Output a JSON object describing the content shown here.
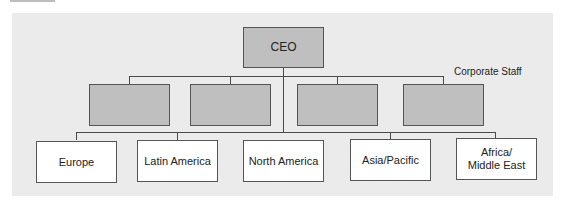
{
  "diagram": {
    "type": "org-chart",
    "root": {
      "label": "CEO"
    },
    "staff_label": "Corporate Staff",
    "staff_boxes": [
      {
        "label": ""
      },
      {
        "label": ""
      },
      {
        "label": ""
      },
      {
        "label": ""
      }
    ],
    "divisions": [
      {
        "label": "Europe"
      },
      {
        "label": "Latin America"
      },
      {
        "label": "North America"
      },
      {
        "label": "Asia/Pacific"
      },
      {
        "label": "Africa/\nMiddle East",
        "line1": "Africa/",
        "line2": "Middle East"
      }
    ],
    "colors": {
      "panel": "#ebebeb",
      "staff_fill": "#bfbfbf",
      "division_fill": "#ffffff",
      "line": "#4a4a4a"
    }
  }
}
